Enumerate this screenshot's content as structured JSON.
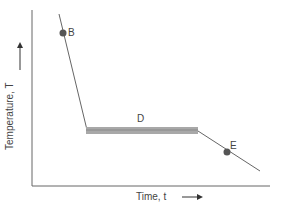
{
  "diagram": {
    "type": "line",
    "xlabel": "Time, t",
    "ylabel": "Temperature, T",
    "points": [
      {
        "label": "B",
        "x": 63,
        "y": 33
      },
      {
        "label": "E",
        "x": 227,
        "y": 152
      }
    ],
    "segment_label": "D",
    "colors": {
      "axis": "#555555",
      "curve": "#666666",
      "plateau": "#9a9a9a",
      "point": "#555555"
    }
  }
}
